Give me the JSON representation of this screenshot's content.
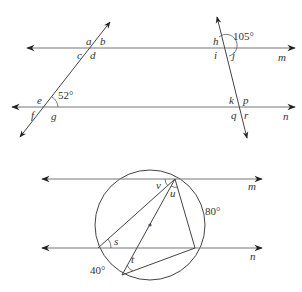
{
  "top_diagram": {
    "line_labels": {
      "m": "m",
      "n": "n"
    },
    "left_intersection_top": {
      "a": "a",
      "b": "b",
      "c": "c",
      "d": "d"
    },
    "left_intersection_bottom": {
      "e": "e",
      "f": "f",
      "g": "g",
      "angle": "52°"
    },
    "right_intersection_top": {
      "h": "h",
      "i": "i",
      "j": "j",
      "angle": "105°"
    },
    "right_intersection_bottom": {
      "k": "k",
      "p": "p",
      "q": "q",
      "r": "r"
    }
  },
  "bottom_diagram": {
    "line_labels": {
      "m": "m",
      "n": "n"
    },
    "angle_labels": {
      "v": "v",
      "u": "u",
      "s": "s",
      "t": "t"
    },
    "arc_labels": {
      "arc_right": "80°",
      "arc_bottom_left": "40°"
    }
  },
  "colors": {
    "line": "#444444",
    "horizontal_line": "#777777",
    "center_dot": "#3a5a9a"
  }
}
